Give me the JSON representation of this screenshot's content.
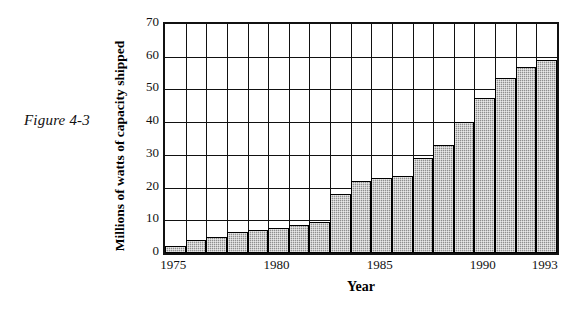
{
  "figure": {
    "caption": "Figure 4-3"
  },
  "chart_data": {
    "type": "bar",
    "title": "",
    "xlabel": "Year",
    "ylabel": "Millions of watts of capacity shipped",
    "categories": [
      "1975",
      "1976",
      "1977",
      "1978",
      "1979",
      "1980",
      "1981",
      "1982",
      "1983",
      "1984",
      "1985",
      "1986",
      "1987",
      "1988",
      "1989",
      "1990",
      "1991",
      "1992",
      "1993"
    ],
    "values": [
      2,
      4,
      5,
      6.5,
      7,
      7.5,
      8.5,
      9.5,
      18,
      22,
      23,
      23.5,
      29,
      33,
      40,
      47.5,
      53.5,
      57,
      59
    ],
    "ylim": [
      0,
      70
    ],
    "yticks": [
      0,
      10,
      20,
      30,
      40,
      50,
      60,
      70
    ],
    "ytick_labels": [
      "0",
      "10",
      "20",
      "30",
      "40",
      "50",
      "60",
      "70"
    ],
    "xtick_labels": [
      "1975",
      "1980",
      "1985",
      "1990",
      "1993"
    ],
    "xtick_categories": [
      "1975",
      "1980",
      "1985",
      "1990",
      "1993"
    ],
    "grid": true,
    "legend": "none",
    "bar_fill_color": "#8e8e8e",
    "bar_edge_color": "#000000",
    "axis_color": "#111111",
    "background_color": "#ffffff"
  }
}
